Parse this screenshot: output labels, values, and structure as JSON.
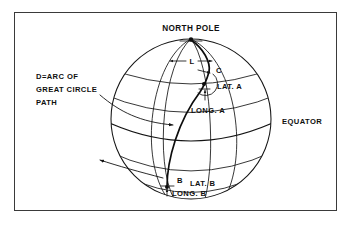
{
  "figure": {
    "type": "great-circle-navigation-diagram",
    "labels": {
      "north_pole": "NORTH POLE",
      "equator": "EQUATOR",
      "arc_legend_line1": "D=ARC OF",
      "arc_legend_line2": "GREAT CIRCLE",
      "arc_legend_line3": "PATH",
      "longitude_difference": "L",
      "course_angle": "C",
      "lat_a": "LAT. A",
      "long_a": "LONG. A",
      "point_a": "A",
      "point_b": "B",
      "lat_b": "LAT. B",
      "long_b": "LONG. B"
    },
    "colors": {
      "ink": "#141414",
      "frame": "#3a3a3a",
      "background": "#ffffff"
    }
  }
}
